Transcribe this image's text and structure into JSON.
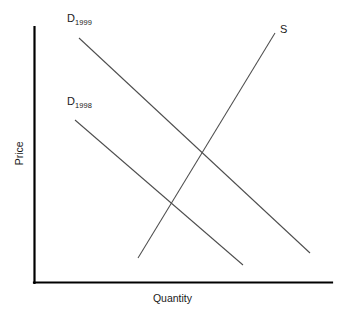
{
  "chart_data": {
    "type": "line",
    "title": "",
    "xlabel": "Quantity",
    "ylabel": "Price",
    "grid": false,
    "legend_position": "inline-curve-labels",
    "axes": {
      "x_axis": {
        "label": "Quantity",
        "ticks": [],
        "range_note": "unlabeled ordinal axis"
      },
      "y_axis": {
        "label": "Price",
        "ticks": [],
        "range_note": "unlabeled ordinal axis"
      }
    },
    "series": [
      {
        "name": "D_1999",
        "label_text": "D",
        "label_subscript": "1999",
        "kind": "demand",
        "slope": "downward",
        "points": [
          [
            79,
            38
          ],
          [
            310,
            253
          ]
        ]
      },
      {
        "name": "D_1998",
        "label_text": "D",
        "label_subscript": "1998",
        "kind": "demand",
        "slope": "downward",
        "points": [
          [
            75,
            120
          ],
          [
            243,
            265
          ]
        ]
      },
      {
        "name": "S",
        "label_text": "S",
        "label_subscript": "",
        "kind": "supply",
        "slope": "upward",
        "points": [
          [
            138,
            258
          ],
          [
            275,
            33
          ]
        ]
      }
    ],
    "intersections": [
      {
        "name": "equilibrium-1999",
        "curves": [
          "S",
          "D_1999"
        ],
        "point": [
          205,
          155
        ]
      },
      {
        "name": "equilibrium-1998",
        "curves": [
          "S",
          "D_1998"
        ],
        "point": [
          172,
          200
        ]
      }
    ],
    "colors": {
      "axis": "#000000",
      "curve": "#4d4d4d",
      "text": "#1a1a1a",
      "background": "#ffffff"
    }
  },
  "labels": {
    "d1999": {
      "letter": "D",
      "subscript": "1999"
    },
    "d1998": {
      "letter": "D",
      "subscript": "1998"
    },
    "supply": {
      "letter": "S"
    },
    "y_axis": "Price",
    "x_axis": "Quantity"
  }
}
